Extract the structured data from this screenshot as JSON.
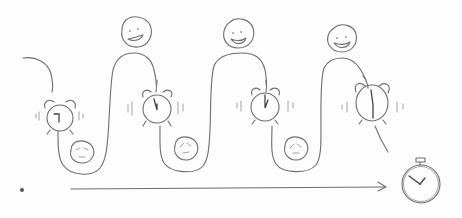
{
  "illustration": {
    "style": "hand-drawn pencil sketch",
    "stroke_color": "#6e6e6e",
    "background_color": "#fdfdfd",
    "description": "Wavy path of daily cycles: alarm clocks ringing between sad faces (troughs) and happy faces (peaks), with a timeline arrow leading to a stopwatch",
    "cycles": [
      {
        "alarm_clock": "ringing-alarm-clock",
        "low_face": "sad-face",
        "high_face": "happy-face"
      },
      {
        "alarm_clock": "ringing-alarm-clock",
        "low_face": "sad-face",
        "high_face": "happy-face"
      },
      {
        "alarm_clock": "ringing-alarm-clock",
        "low_face": "sad-face",
        "high_face": "happy-face"
      },
      {
        "alarm_clock": "ringing-alarm-clock"
      }
    ],
    "timeline": {
      "start": "dot",
      "direction": "arrow-right",
      "end_icon": "stopwatch-icon"
    }
  }
}
